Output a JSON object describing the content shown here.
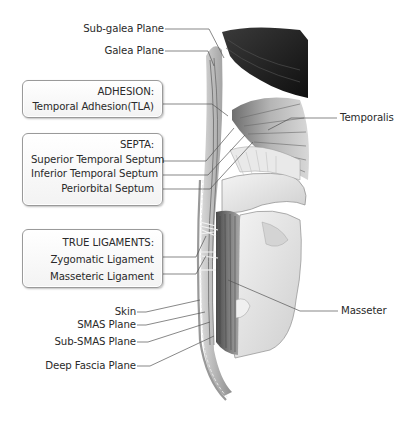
{
  "diagram": {
    "type": "anatomical-illustration",
    "left_labels": [
      {
        "id": "sub-galea-plane",
        "text": "Sub-galea Plane"
      },
      {
        "id": "galea-plane",
        "text": "Galea Plane"
      },
      {
        "id": "skin",
        "text": "Skin"
      },
      {
        "id": "smas-plane",
        "text": "SMAS Plane"
      },
      {
        "id": "sub-smas-plane",
        "text": "Sub-SMAS Plane"
      },
      {
        "id": "deep-fascia-plane",
        "text": "Deep Fascia Plane"
      }
    ],
    "right_labels": [
      {
        "id": "temporalis",
        "text": "Temporalis"
      },
      {
        "id": "masseter",
        "text": "Masseter"
      }
    ],
    "boxes": [
      {
        "id": "adhesion",
        "heading": "ADHESION:",
        "items": [
          "Temporal Adhesion(TLA)"
        ]
      },
      {
        "id": "septa",
        "heading": "SEPTA:",
        "items": [
          "Superior Temporal Septum",
          "Inferior Temporal Septum",
          "Periorbital Septum"
        ]
      },
      {
        "id": "true-ligaments",
        "heading": "TRUE LIGAMENTS:",
        "items": [
          "Zygomatic Ligament",
          "Masseteric Ligament"
        ]
      }
    ],
    "colors": {
      "background": "#ffffff",
      "text": "#2a2a2a",
      "leader_line": "#555555",
      "box_border": "#9a9a9a",
      "hair": "#1e1e1e",
      "muscle": "#8a8a8a",
      "bone": "#e6e6e6"
    }
  }
}
